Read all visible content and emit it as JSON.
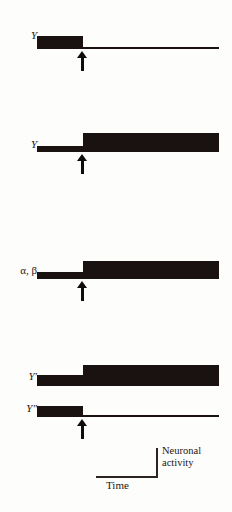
{
  "figure": {
    "kind": "neuronal-activity-step-traces",
    "ink_color": "#191210",
    "background_color": "#fdfdfc",
    "trace_count": 5,
    "transition_x_px": 83
  },
  "traces": [
    {
      "label": "Y",
      "label_style": "italic",
      "pre_level": "high",
      "post_level": "low",
      "pre_thickness_px": 13,
      "post_thickness_px": 2,
      "has_arrow": true
    },
    {
      "label": "Y",
      "label_style": "italic",
      "pre_level": "low",
      "post_level": "high",
      "pre_thickness_px": 6,
      "post_thickness_px": 19,
      "has_arrow": true
    },
    {
      "label": "α, β",
      "label_style": "upright",
      "pre_level": "low",
      "post_level": "high",
      "pre_thickness_px": 7,
      "post_thickness_px": 18,
      "has_arrow": true
    },
    {
      "label": "Y′",
      "label_style": "italic",
      "pre_level": "low",
      "post_level": "high",
      "pre_thickness_px": 11,
      "post_thickness_px": 21,
      "has_arrow": false
    },
    {
      "label": "Y″",
      "label_style": "italic",
      "pre_level": "high",
      "post_level": "low",
      "pre_thickness_px": 11,
      "post_thickness_px": 2,
      "has_arrow": true
    }
  ],
  "legend": {
    "time_label": "Time",
    "activity_label_line1": "Neuronal",
    "activity_label_line2": "activity",
    "axis_color": "#2a2320"
  }
}
